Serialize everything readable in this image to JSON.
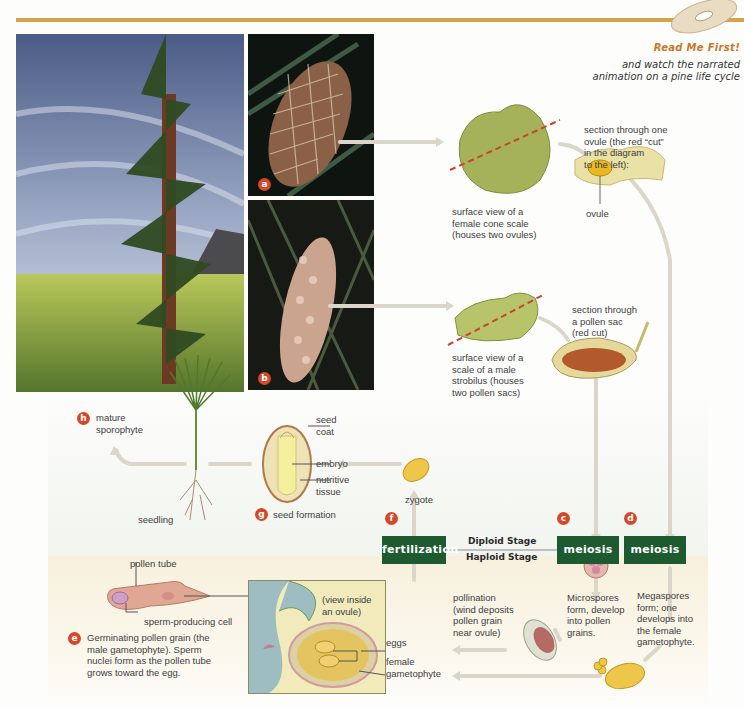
{
  "header": {
    "cd_icon": "cd-disc-icon",
    "read_me_title": "Read Me First!",
    "read_me_line1": "and watch the narrated",
    "read_me_line2": "animation on a pine life cycle"
  },
  "photos": {
    "tree": {
      "name": "mature-pine-tree-photo"
    },
    "female_cone": {
      "name": "female-cone-photo",
      "badge": "a"
    },
    "male_strobilus": {
      "name": "male-strobilus-photo",
      "badge": "b"
    }
  },
  "labels": {
    "female_scale": [
      "surface view of a",
      "female cone scale",
      "(houses two ovules)"
    ],
    "ovule_section": [
      "section through one",
      "ovule (the red “cut”",
      "in the diagram",
      "to the left):"
    ],
    "ovule": "ovule",
    "male_scale": [
      "surface view of a",
      "scale of a male",
      "strobilus (houses",
      "two pollen sacs)"
    ],
    "pollen_sac_section": [
      "section through",
      "a pollen sac",
      "(red cut)"
    ],
    "mature_sporophyte": {
      "badge": "h",
      "lines": [
        "mature",
        "sporophyte"
      ]
    },
    "seedling": "seedling",
    "seed_coat": [
      "seed",
      "coat"
    ],
    "embryo": "embryo",
    "nutritive_tissue": [
      "nutritive",
      "tissue"
    ],
    "seed_formation": {
      "badge": "g",
      "text": "seed formation"
    },
    "zygote": "zygote",
    "pollen_tube": "pollen tube",
    "sperm_cell": "sperm-producing cell",
    "germinating": {
      "badge": "e",
      "lines": [
        "Germinating pollen grain (the",
        "male gametophyte). Sperm",
        "nuclei form as the pollen tube",
        "grows toward the egg."
      ]
    },
    "view_inside": [
      "(view inside",
      "an ovule)"
    ],
    "eggs": "eggs",
    "female_gametophyte": [
      "female",
      "gametophyte"
    ],
    "pollination": [
      "pollination",
      "(wind deposits",
      "pollen grain",
      "near ovule)"
    ],
    "microspores": [
      "Microspores",
      "form, develop",
      "into pollen",
      "grains."
    ],
    "megaspores": [
      "Megaspores",
      "form; one",
      "develops into",
      "the female",
      "gametophyte."
    ]
  },
  "stages": {
    "fertilization": {
      "badge": "f",
      "label": "fertilization"
    },
    "meiosis_c": {
      "badge": "c",
      "label": "meiosis"
    },
    "meiosis_d": {
      "badge": "d",
      "label": "meiosis"
    },
    "diploid": "Diploid Stage",
    "haploid": "Haploid Stage"
  },
  "colors": {
    "accent_bar": "#d5a24e",
    "stage_box": "#1d5a2f",
    "badge": "#d4482a",
    "arrow": "#d9d3c6",
    "cut_line": "#c8442c"
  }
}
